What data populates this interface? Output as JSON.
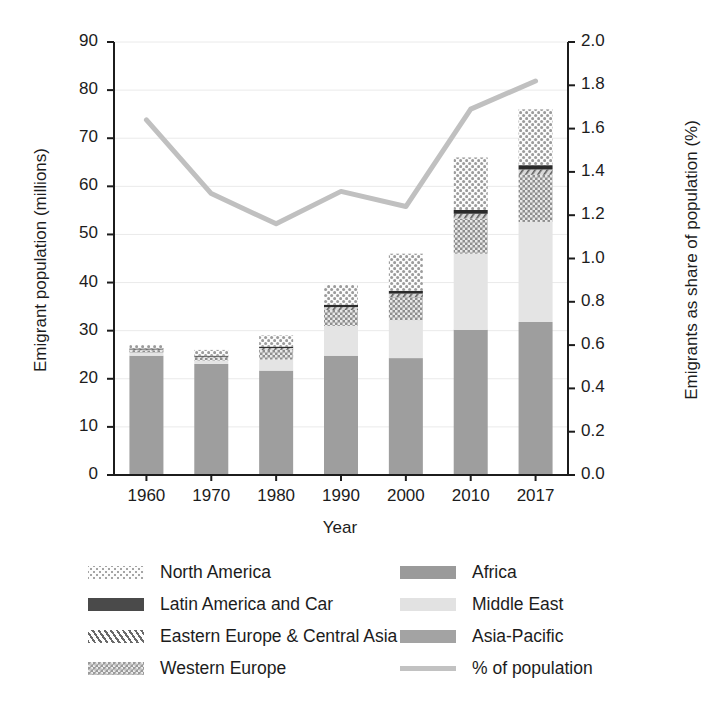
{
  "chart_data": {
    "type": "bar",
    "subtype": "stacked-bar-with-line-overlay",
    "title": "",
    "xlabel": "Year",
    "ylabel": "Emigrant population (millions)",
    "y2label": "Emigrants as share of population (%)",
    "categories": [
      "1960",
      "1970",
      "1980",
      "1990",
      "2000",
      "2010",
      "2017"
    ],
    "ylim": [
      0,
      90
    ],
    "yticks": [
      "0",
      "10",
      "20",
      "30",
      "40",
      "50",
      "60",
      "70",
      "80",
      "90"
    ],
    "y2lim": [
      0.0,
      2.0
    ],
    "y2ticks": [
      "0.0",
      "0.2",
      "0.4",
      "0.6",
      "0.8",
      "1.0",
      "1.2",
      "1.4",
      "1.6",
      "1.8",
      "2.0"
    ],
    "grid": true,
    "legend_position": "below",
    "series": [
      {
        "name": "Asia-Pacific",
        "axis": "left",
        "values": [
          24.8,
          23.1,
          21.7,
          24.8,
          24.3,
          30.2,
          31.8
        ]
      },
      {
        "name": "Middle East",
        "axis": "left",
        "values": [
          0.6,
          0.7,
          2.3,
          6.2,
          7.9,
          15.8,
          20.8
        ]
      },
      {
        "name": "Western Europe",
        "axis": "left",
        "values": [
          0.5,
          0.6,
          2.0,
          3.3,
          4.8,
          7.3,
          9.8
        ]
      },
      {
        "name": "Eastern Europe & Central Asia",
        "axis": "left",
        "values": [
          0.2,
          0.2,
          0.4,
          0.6,
          0.7,
          1.0,
          1.1
        ]
      },
      {
        "name": "Latin America and Car",
        "axis": "left",
        "values": [
          0.2,
          0.2,
          0.3,
          0.5,
          0.6,
          0.8,
          0.9
        ]
      },
      {
        "name": "North America",
        "axis": "left",
        "values": [
          0.7,
          1.2,
          2.3,
          4.1,
          7.7,
          10.9,
          11.6
        ]
      },
      {
        "name": "% of population",
        "axis": "right",
        "type": "line",
        "values": [
          1.64,
          1.3,
          1.16,
          1.31,
          1.24,
          1.69,
          1.82
        ]
      }
    ],
    "totals": [
      27.0,
      26.0,
      29.0,
      39.5,
      46.0,
      66.0,
      76.0
    ]
  },
  "axes": {
    "x_title": "Year",
    "y_left_title": "Emigrant population (millions)",
    "y_right_title": "Emigrants as share of population (%)"
  },
  "legend": {
    "left_column": [
      {
        "label": "North America",
        "pattern": "dots-light",
        "color": "#d9d9d9"
      },
      {
        "label": "Latin America and Car",
        "pattern": "solid-dark",
        "color": "#4a4a4a"
      },
      {
        "label": "Eastern Europe & Central Asia",
        "pattern": "hatch-diagonal",
        "color": "#bdbdbd"
      },
      {
        "label": "Western Europe",
        "pattern": "checker-dark",
        "color": "#8e8e8e"
      }
    ],
    "right_column": [
      {
        "label": "Africa",
        "pattern": "solid",
        "color": "#9a9a9a"
      },
      {
        "label": "Middle East",
        "pattern": "solid",
        "color": "#e2e2e2"
      },
      {
        "label": "Asia-Pacific",
        "pattern": "solid",
        "color": "#a3a3a3"
      },
      {
        "label": "% of population",
        "pattern": "line",
        "color": "#c2c2c2"
      }
    ]
  },
  "colors": {
    "asia_pacific": "#9e9e9e",
    "middle_east": "#e4e4e4",
    "western_europe": "#8c8c8c",
    "eastern_europe": "#2b2b2b",
    "latin_america": "#2b2b2b",
    "north_america": "#c9c9c9",
    "line": "#c0c0c0",
    "axis": "#1c1c1c",
    "grid": "#e8e8e8"
  }
}
